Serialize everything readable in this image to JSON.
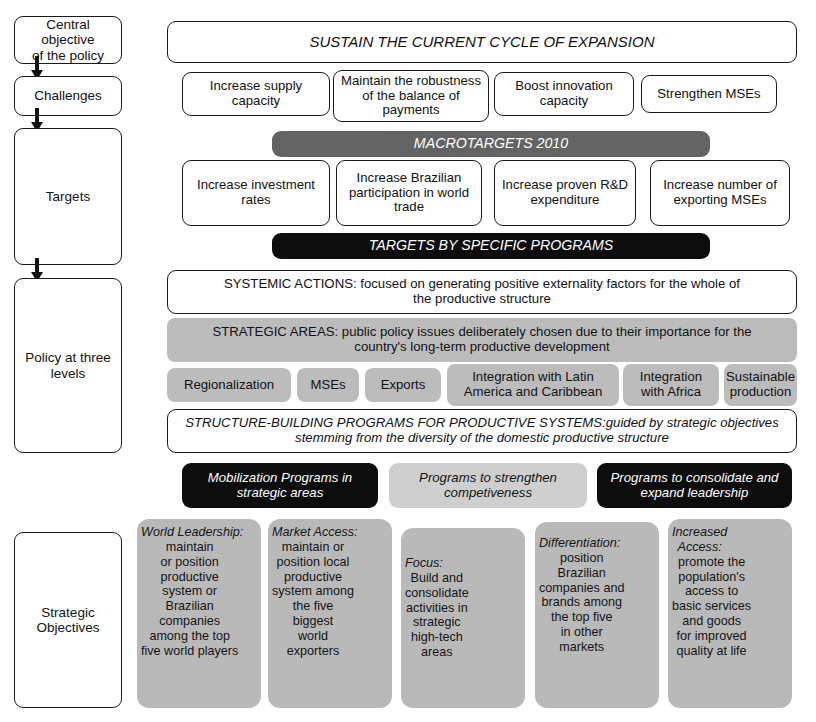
{
  "sidebar": {
    "items": [
      {
        "label": "Central objective\nof the policy"
      },
      {
        "label": "Challenges"
      },
      {
        "label": "Targets"
      },
      {
        "label": "Policy at three\nlevels"
      },
      {
        "label": "Strategic\nObjectives"
      }
    ],
    "arrow_icon": "down-arrow-icon"
  },
  "central_objective": {
    "title": "SUSTAIN THE CURRENT CYCLE OF EXPANSION"
  },
  "challenges": {
    "items": [
      "Increase supply capacity",
      "Maintain the robustness of the balance of payments",
      "Boost innovation capacity",
      "Strengthen MSEs"
    ]
  },
  "macrotargets": {
    "band": "MACROTARGETS 2010",
    "items": [
      "Increase investment rates",
      "Increase Brazilian participation in world trade",
      "Increase proven R&D expenditure",
      "Increase number of exporting MSEs"
    ],
    "specific_band": "TARGETS BY SPECIFIC PROGRAMS"
  },
  "policy_levels": {
    "systemic_actions": "SYSTEMIC ACTIONS: focused on generating positive externality factors for the whole of the productive structure",
    "strategic_areas": "STRATEGIC AREAS: public policy issues deliberately chosen due to their importance for the country's long-term productive development",
    "area_chips": [
      "Regionalization",
      "MSEs",
      "Exports",
      "Integration with Latin America and Caribbean",
      "Integration with Africa",
      "Sustainable production"
    ],
    "structure_building": "STRUCTURE-BUILDING PROGRAMS FOR PRODUCTIVE SYSTEMS:guided by strategic objectives stemming from the diversity of the domestic productive structure",
    "programs": [
      {
        "label": "Mobilization Programs in strategic areas",
        "style": "black"
      },
      {
        "label": "Programs to strengthen competiveness",
        "style": "light"
      },
      {
        "label": "Programs to consolidate and expand leadership",
        "style": "black"
      }
    ]
  },
  "strategic_objectives": {
    "columns": [
      {
        "heading": "World Leadership:",
        "body": "maintain\nor position\nproductive\nsystem or\nBrazilian\ncompanies\namong the top\nfive world players"
      },
      {
        "heading": "Market Access:",
        "body": "maintain or\nposition local\nproductive\nsystem among\nthe five\nbiggest\nworld\nexporters"
      },
      {
        "heading": "Focus:",
        "body": "Build and\nconsolidate\nactivities in\nstrategic\nhigh-tech\nareas"
      },
      {
        "heading": "Differentiation:",
        "body": "position\nBrazilian\ncompanies and\nbrands among\nthe top five\nin other\nmarkets"
      },
      {
        "heading": "Increased\nAccess:",
        "body": "promote the\npopulation's\naccess to\nbasic services\nand goods\nfor improved\nquality at life"
      }
    ]
  },
  "colors": {
    "dark_band": "#636363",
    "black_band": "#0d0d0d",
    "mid_gray": "#bcbcbc",
    "light_gray": "#cfcfcf",
    "objective_gray": "#b9b9b9",
    "outline": "#1a1a1a"
  }
}
